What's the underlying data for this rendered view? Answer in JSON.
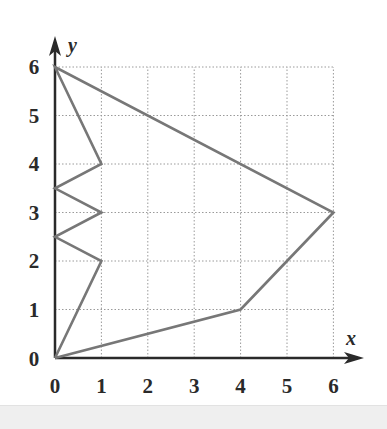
{
  "chart_data": {
    "type": "line",
    "title": "",
    "xlabel": "x",
    "ylabel": "y",
    "xlim": [
      0,
      6
    ],
    "ylim": [
      0,
      6
    ],
    "x_ticks": [
      "0",
      "1",
      "2",
      "3",
      "4",
      "5",
      "6"
    ],
    "y_ticks": [
      "0",
      "1",
      "2",
      "3",
      "4",
      "5",
      "6"
    ],
    "grid": true,
    "grid_style": "dotted",
    "legend": null,
    "series": [
      {
        "name": "polygon",
        "closed": true,
        "color": "#777777",
        "points": [
          [
            0,
            0
          ],
          [
            1,
            2
          ],
          [
            0,
            2.5
          ],
          [
            1,
            3
          ],
          [
            0,
            3.5
          ],
          [
            1,
            4
          ],
          [
            0,
            6
          ],
          [
            6,
            3
          ],
          [
            4,
            1
          ],
          [
            0,
            0
          ]
        ]
      }
    ]
  },
  "colors": {
    "axis": "#2a2a2a",
    "grid": "#9a9a9a",
    "polygon": "#777777",
    "background": "#ffffff"
  }
}
